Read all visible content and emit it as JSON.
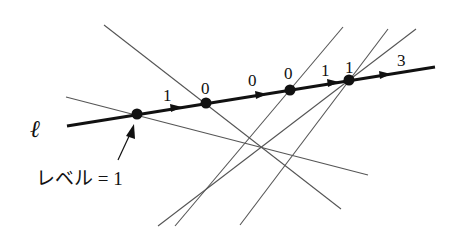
{
  "diagram": {
    "line_label": "ℓ",
    "edge_labels": [
      "1",
      "0",
      "0",
      "0",
      "1",
      "1",
      "3"
    ],
    "annotation": "レベル = 1",
    "colors": {
      "main_line": "#111111",
      "thin_line": "#555555",
      "background": "#ffffff"
    },
    "main_line": {
      "from": [
        67,
        126
      ],
      "to": [
        435,
        67
      ]
    },
    "points": [
      [
        137,
        114
      ],
      [
        206,
        103
      ],
      [
        290,
        90
      ],
      [
        349,
        80
      ]
    ],
    "thin_lines": [
      {
        "from": [
          104,
          25
        ],
        "to": [
          341,
          209
        ]
      },
      {
        "from": [
          66,
          97
        ],
        "to": [
          368,
          175
        ]
      },
      {
        "from": [
          343,
          27
        ],
        "to": [
          175,
          226
        ]
      },
      {
        "from": [
          388,
          29
        ],
        "to": [
          240,
          225
        ]
      },
      {
        "from": [
          416,
          29
        ],
        "to": [
          158,
          226
        ]
      }
    ]
  }
}
